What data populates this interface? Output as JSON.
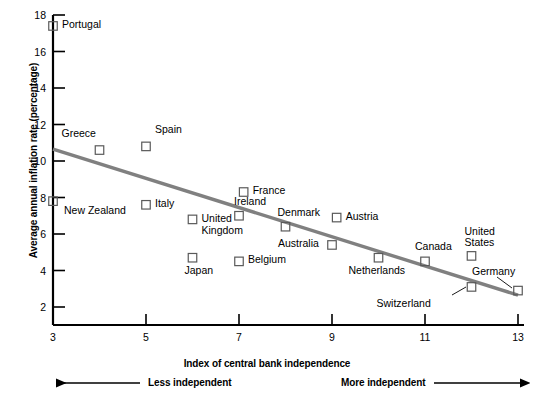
{
  "chart_data": {
    "type": "scatter",
    "title": "",
    "xlabel": "Index of central bank independence",
    "ylabel": "Average annual inflation rate (percentage)",
    "xlim": [
      3,
      13
    ],
    "ylim": [
      0,
      18
    ],
    "xticks": [
      3,
      5,
      7,
      9,
      11,
      13
    ],
    "yticks": [
      2,
      4,
      6,
      8,
      10,
      12,
      14,
      16,
      18
    ],
    "grid": false,
    "legend": null,
    "marker": "open-square",
    "points": [
      {
        "label": "Portugal",
        "x": 3.0,
        "y": 17.4
      },
      {
        "label": "Greece",
        "x": 4.0,
        "y": 10.6
      },
      {
        "label": "Spain",
        "x": 5.0,
        "y": 10.8
      },
      {
        "label": "New Zealand",
        "x": 3.0,
        "y": 7.8
      },
      {
        "label": "Italy",
        "x": 5.0,
        "y": 7.6
      },
      {
        "label": "France",
        "x": 7.1,
        "y": 8.3
      },
      {
        "label": "Ireland",
        "x": 7.0,
        "y": 7.0
      },
      {
        "label": "United Kingdom",
        "x": 6.0,
        "y": 6.8
      },
      {
        "label": "Denmark",
        "x": 8.0,
        "y": 6.4
      },
      {
        "label": "Austria",
        "x": 9.1,
        "y": 6.9
      },
      {
        "label": "Japan",
        "x": 6.0,
        "y": 4.7
      },
      {
        "label": "Belgium",
        "x": 7.0,
        "y": 4.5
      },
      {
        "label": "Australia",
        "x": 9.0,
        "y": 5.4
      },
      {
        "label": "Netherlands",
        "x": 10.0,
        "y": 4.7
      },
      {
        "label": "Canada",
        "x": 11.0,
        "y": 4.5
      },
      {
        "label": "United States",
        "x": 12.0,
        "y": 4.8
      },
      {
        "label": "Switzerland",
        "x": 12.0,
        "y": 3.1
      },
      {
        "label": "Germany",
        "x": 13.0,
        "y": 2.9
      }
    ],
    "trendline": {
      "x0": 3,
      "y0": 10.65,
      "x1": 13,
      "y1": 2.65,
      "color": "#808080"
    },
    "annotations": {
      "left_direction": "Less independent",
      "right_direction": "More independent"
    },
    "colors": {
      "axis": "#000000",
      "marker": "#5a5a5a",
      "trendline": "#808080"
    }
  }
}
